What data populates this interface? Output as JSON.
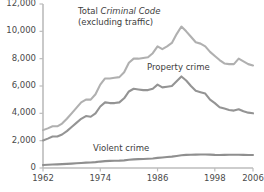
{
  "chart_data": {
    "type": "line",
    "title": "",
    "subtitle": "",
    "xlabel": "",
    "ylabel": "",
    "xlim": [
      1962,
      2006
    ],
    "ylim": [
      0,
      12000
    ],
    "grid": false,
    "legend_position": "inline-annotations",
    "x_ticks": [
      "1962",
      "1974",
      "1986",
      "1998",
      "2006"
    ],
    "x_tick_values": [
      1962,
      1974,
      1986,
      1998,
      2006
    ],
    "y_ticks": [
      "0",
      "2,000",
      "4,000",
      "6,000",
      "8,000",
      "10,000",
      "12,000"
    ],
    "y_tick_values": [
      0,
      2000,
      4000,
      6000,
      8000,
      10000,
      12000
    ],
    "x": [
      1962,
      1963,
      1964,
      1965,
      1966,
      1967,
      1968,
      1969,
      1970,
      1971,
      1972,
      1973,
      1974,
      1975,
      1976,
      1977,
      1978,
      1979,
      1980,
      1981,
      1982,
      1983,
      1984,
      1985,
      1986,
      1987,
      1988,
      1989,
      1990,
      1991,
      1992,
      1993,
      1994,
      1995,
      1996,
      1997,
      1998,
      1999,
      2000,
      2001,
      2002,
      2003,
      2004,
      2005,
      2006
    ],
    "series": [
      {
        "name": "Total Criminal Code (excluding traffic)",
        "color": "#b0b0b0",
        "values": [
          2771,
          2900,
          3050,
          3050,
          3250,
          3600,
          4000,
          4400,
          4800,
          5000,
          5000,
          5400,
          6100,
          6550,
          6550,
          6600,
          6650,
          7000,
          7700,
          8000,
          8000,
          8050,
          8100,
          8400,
          8900,
          8700,
          8900,
          9150,
          9800,
          10350,
          10000,
          9600,
          9200,
          9100,
          8900,
          8500,
          8200,
          7900,
          7650,
          7600,
          7600,
          8000,
          7800,
          7600,
          7500
        ]
      },
      {
        "name": "Property crime",
        "color": "#949494",
        "values": [
          2018,
          2150,
          2300,
          2300,
          2450,
          2700,
          3000,
          3300,
          3600,
          3800,
          3750,
          4000,
          4500,
          4800,
          4750,
          4750,
          4800,
          5100,
          5600,
          5800,
          5750,
          5700,
          5700,
          5800,
          6100,
          5900,
          5950,
          6000,
          6350,
          6700,
          6400,
          6000,
          5650,
          5550,
          5450,
          5000,
          4750,
          4450,
          4350,
          4250,
          4200,
          4300,
          4150,
          4050,
          4000
        ]
      },
      {
        "name": "Violent crime",
        "color": "#8f8f8f",
        "values": [
          221,
          240,
          255,
          265,
          280,
          300,
          320,
          345,
          370,
          390,
          400,
          430,
          470,
          500,
          520,
          530,
          540,
          560,
          600,
          630,
          650,
          660,
          680,
          700,
          740,
          770,
          800,
          830,
          880,
          930,
          960,
          970,
          980,
          990,
          990,
          980,
          960,
          950,
          960,
          970,
          970,
          970,
          960,
          950,
          950
        ]
      }
    ],
    "annotations": [
      {
        "id": "total-criminal-code-label",
        "line1_prefix": "Total ",
        "line1_italic": "Criminal Code",
        "line2": "(excluding traffic)"
      },
      {
        "id": "property-crime-label",
        "text": "Property crime"
      },
      {
        "id": "violent-crime-label",
        "text": "Violent crime"
      }
    ],
    "axis_color": "#b5b5b5",
    "text_color": "#4a4a4a"
  }
}
